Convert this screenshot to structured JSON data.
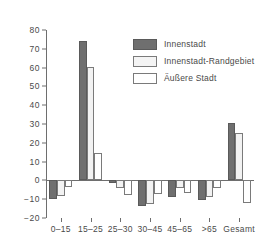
{
  "chart_data": {
    "type": "bar",
    "title": "",
    "subtitle": "",
    "xlabel": "",
    "ylabel": "",
    "grid": false,
    "legend_position": "inside-top-right",
    "categories": [
      "0–15",
      "15–25",
      "25–30",
      "30–45",
      "45–65",
      ">65",
      "Gesamt"
    ],
    "ylim": [
      -20,
      80
    ],
    "yticks": [
      -20,
      -10,
      0,
      10,
      20,
      30,
      40,
      50,
      60,
      70,
      80
    ],
    "ytick_labels": [
      "−20",
      "−10",
      "0",
      "10",
      "20",
      "30",
      "40",
      "50",
      "60",
      "70",
      "80"
    ],
    "series": [
      {
        "name": "Innenstadt",
        "color": "#6f6f6f",
        "values": [
          -10,
          74,
          -1.5,
          -13.5,
          -9,
          -10.5,
          30.5
        ]
      },
      {
        "name": "Innenstadt-Randgebiet",
        "color": "#f2f2f2",
        "values": [
          -8.5,
          60.5,
          -4,
          -12.5,
          -4,
          -9,
          25
        ]
      },
      {
        "name": "Äußere Stadt",
        "color": "#ffffff",
        "values": [
          -3.5,
          14.5,
          -8,
          -7.5,
          -6.5,
          -4,
          -12
        ]
      }
    ]
  },
  "legend": {
    "items": [
      {
        "label": "Innenstadt"
      },
      {
        "label": "Innenstadt-Randgebiet"
      },
      {
        "label": "Äußere Stadt"
      }
    ]
  }
}
